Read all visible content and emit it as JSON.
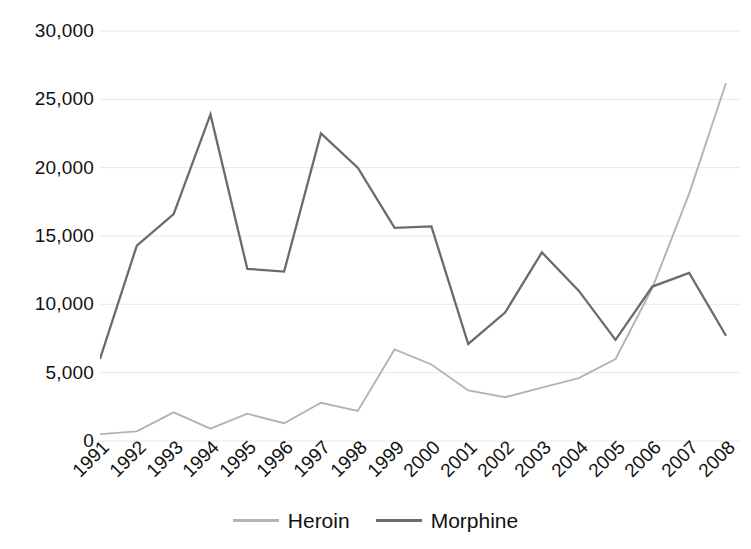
{
  "chart_data": {
    "type": "line",
    "title": "",
    "xlabel": "",
    "ylabel": "",
    "categories": [
      "1991",
      "1992",
      "1993",
      "1994",
      "1995",
      "1996",
      "1997",
      "1998",
      "1999",
      "2000",
      "2001",
      "2002",
      "2003",
      "2004",
      "2005",
      "2006",
      "2007",
      "2008"
    ],
    "series": [
      {
        "name": "Heroin",
        "color": "#b3b3b3",
        "values": [
          500,
          700,
          2100,
          900,
          2000,
          1300,
          2800,
          2200,
          6700,
          5600,
          3700,
          3200,
          3900,
          4600,
          6000,
          11200,
          18100,
          26200
        ]
      },
      {
        "name": "Morphine",
        "color": "#6b6b6b",
        "values": [
          6000,
          14300,
          16600,
          23900,
          12600,
          12400,
          22500,
          20000,
          15600,
          15700,
          7100,
          9400,
          13800,
          11000,
          7400,
          11300,
          12300,
          7700
        ]
      }
    ],
    "ylim": [
      0,
      30000
    ],
    "ytick_values": [
      0,
      5000,
      10000,
      15000,
      20000,
      25000,
      30000
    ],
    "ytick_labels": [
      "0",
      "5,000",
      "10,000",
      "15,000",
      "20,000",
      "25,000",
      "30,000"
    ],
    "grid": true,
    "grid_color": "#e8e8e8",
    "legend_position": "bottom"
  },
  "legend": {
    "entries": [
      {
        "label": "Heroin",
        "color": "#b3b3b3"
      },
      {
        "label": "Morphine",
        "color": "#6b6b6b"
      }
    ]
  }
}
